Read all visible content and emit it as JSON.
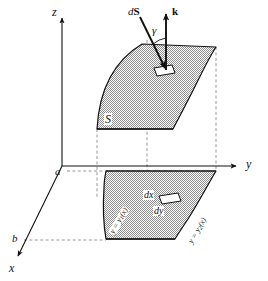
{
  "figure": {
    "type": "math-diagram",
    "axes": {
      "z_label": "z",
      "y_label": "y",
      "x_label": "x"
    },
    "x_axis_marks": [
      {
        "label": "a"
      },
      {
        "label": "b"
      }
    ],
    "surface_label": "S",
    "vectors": {
      "dS_label_d": "d",
      "dS_label_S": "S",
      "k_label": "k",
      "angle_label": "γ"
    },
    "region_labels": {
      "left_boundary_prefix": "y = y",
      "left_boundary_sub": "1",
      "left_boundary_suffix": "(x)",
      "right_boundary_prefix": "y = y",
      "right_boundary_sub": "2",
      "right_boundary_suffix": "(x)",
      "dx_label": "dx",
      "dy_label": "dy"
    },
    "colors": {
      "ink": "#111111",
      "fill_gray": "#a9a9a9",
      "dash_gray": "#8c8c8c",
      "patch_white": "#ffffff"
    }
  }
}
